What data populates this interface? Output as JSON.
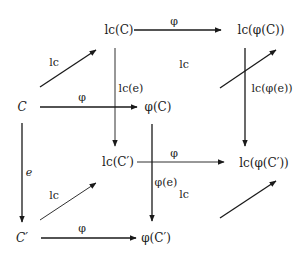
{
  "diagram": {
    "type": "commutative-cube",
    "nodes": {
      "C": {
        "text": "C",
        "x": 22,
        "y": 107
      },
      "phi_C": {
        "text": "φ(C)",
        "x": 158,
        "y": 107
      },
      "lc_C": {
        "text": "lc(C)",
        "x": 119,
        "y": 30
      },
      "lc_phi_C": {
        "text": "lc(φ(C))",
        "x": 261,
        "y": 30
      },
      "C_prime": {
        "text": "C′",
        "x": 22,
        "y": 238
      },
      "phi_C_prime": {
        "text": "φ(C′)",
        "x": 156,
        "y": 238
      },
      "lc_C_prime": {
        "text": "lc(C′)",
        "x": 118,
        "y": 162
      },
      "lc_phi_C_prime": {
        "text": "lc(φ(C′))",
        "x": 264,
        "y": 163
      }
    },
    "arrows": [
      {
        "id": "lcC-to-lcphiC",
        "from": "lc_C",
        "to": "lc_phi_C",
        "label": "φ",
        "x1": 134,
        "y1": 30,
        "x2": 221,
        "y2": 30,
        "lx": 174,
        "ly": 21,
        "weight": 1.3
      },
      {
        "id": "C-to-phiC",
        "from": "C",
        "to": "phi_C",
        "label": "φ",
        "x1": 40,
        "y1": 107,
        "x2": 137,
        "y2": 107,
        "lx": 82,
        "ly": 97,
        "weight": 1.3
      },
      {
        "id": "lcCp-to-lcphiCp",
        "from": "lc_C_prime",
        "to": "lc_phi_C_prime",
        "label": "φ",
        "x1": 137,
        "y1": 162,
        "x2": 224,
        "y2": 162,
        "lx": 174,
        "ly": 153,
        "weight": 0.9
      },
      {
        "id": "Cp-to-phiCp",
        "from": "C_prime",
        "to": "phi_C_prime",
        "label": "φ",
        "x1": 41,
        "y1": 238,
        "x2": 136,
        "y2": 238,
        "lx": 82,
        "ly": 228,
        "weight": 1.3
      },
      {
        "id": "C-to-Cp",
        "from": "C",
        "to": "C_prime",
        "label": "e",
        "x1": 22,
        "y1": 123,
        "x2": 22,
        "y2": 222,
        "lx": 29,
        "ly": 172,
        "weight": 1.3
      },
      {
        "id": "lcC-to-lcCp",
        "from": "lc_C",
        "to": "lc_C_prime",
        "label": "lc(e)",
        "x1": 115,
        "y1": 48,
        "x2": 115,
        "y2": 146,
        "lx": 131,
        "ly": 88,
        "weight": 0.9
      },
      {
        "id": "phiC-to-phiCp",
        "from": "phi_C",
        "to": "phi_C_prime",
        "label": "φ(e)",
        "x1": 152,
        "y1": 124,
        "x2": 152,
        "y2": 221,
        "lx": 166,
        "ly": 182,
        "weight": 1.3
      },
      {
        "id": "lcphiC-to-lcphiCp",
        "from": "lc_phi_C",
        "to": "lc_phi_C_prime",
        "label": "lc(φ(e))",
        "x1": 245,
        "y1": 48,
        "x2": 245,
        "y2": 146,
        "lx": 272,
        "ly": 88,
        "weight": 1.3
      },
      {
        "id": "C-to-lcC",
        "from": "C",
        "to": "lc_C",
        "label": "lc",
        "x1": 40,
        "y1": 87,
        "x2": 96,
        "y2": 50,
        "lx": 54,
        "ly": 62,
        "weight": 1.3
      },
      {
        "id": "phiC-to-lcphiC",
        "from": "phi_C",
        "to": "lc_phi_C",
        "label": "lc",
        "x1": 220,
        "y1": 88,
        "x2": 276,
        "y2": 50,
        "lx": 184,
        "ly": 64,
        "weight": 1.3
      },
      {
        "id": "Cp-to-lcCp",
        "from": "C_prime",
        "to": "lc_C_prime",
        "label": "lc",
        "x1": 40,
        "y1": 220,
        "x2": 96,
        "y2": 183,
        "lx": 54,
        "ly": 195,
        "weight": 0.9
      },
      {
        "id": "phiCp-to-lcphiCp",
        "from": "phi_C_prime",
        "to": "lc_phi_C_prime",
        "label": "lc",
        "x1": 220,
        "y1": 218,
        "x2": 276,
        "y2": 181,
        "lx": 184,
        "ly": 194,
        "weight": 1.3
      }
    ],
    "colors": {
      "ink": "#1a1a1a",
      "background": "#ffffff"
    }
  }
}
